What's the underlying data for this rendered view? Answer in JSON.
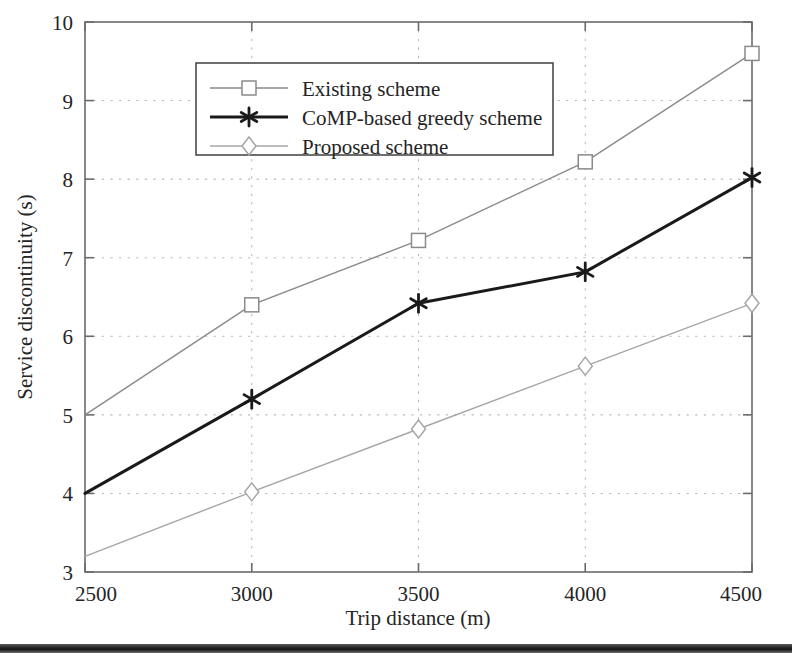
{
  "chart_data": {
    "type": "line",
    "title": "",
    "xlabel": "Trip distance (m)",
    "ylabel": "Service discontinuity (s)",
    "x": [
      2500,
      3000,
      3500,
      4000,
      4500
    ],
    "xticklabels": [
      "2500",
      "3000",
      "3500",
      "4000",
      "4500"
    ],
    "yticklabels": [
      "3",
      "4",
      "5",
      "6",
      "7",
      "8",
      "9",
      "10"
    ],
    "yticks": [
      3,
      4,
      5,
      6,
      7,
      8,
      9,
      10
    ],
    "xlim": [
      2500,
      4500
    ],
    "ylim": [
      3,
      10
    ],
    "grid": "dotted",
    "legend_position": "upper-left-inside",
    "series": [
      {
        "name": "Existing scheme",
        "values": [
          5.0,
          6.4,
          7.22,
          8.22,
          9.6
        ],
        "marker": "square-open",
        "color": "#8a8a8a",
        "linewidth": 1.4
      },
      {
        "name": "CoMP-based greedy scheme",
        "values": [
          4.0,
          5.2,
          6.42,
          6.82,
          8.02
        ],
        "marker": "asterisk",
        "color": "#1a1a1a",
        "linewidth": 3.0
      },
      {
        "name": "Proposed scheme",
        "values": [
          3.2,
          4.02,
          4.82,
          5.62,
          6.42
        ],
        "marker": "diamond-open",
        "color": "#a6a6a6",
        "linewidth": 1.4
      }
    ]
  },
  "axes": {
    "frame_color": "#6b6b6b",
    "grid_color": "#b9b9b9"
  },
  "legend": {
    "entries": [
      {
        "label": "Existing scheme"
      },
      {
        "label": "CoMP-based greedy scheme"
      },
      {
        "label": "Proposed scheme"
      }
    ]
  },
  "footer": {
    "rule_color": "#222222"
  }
}
